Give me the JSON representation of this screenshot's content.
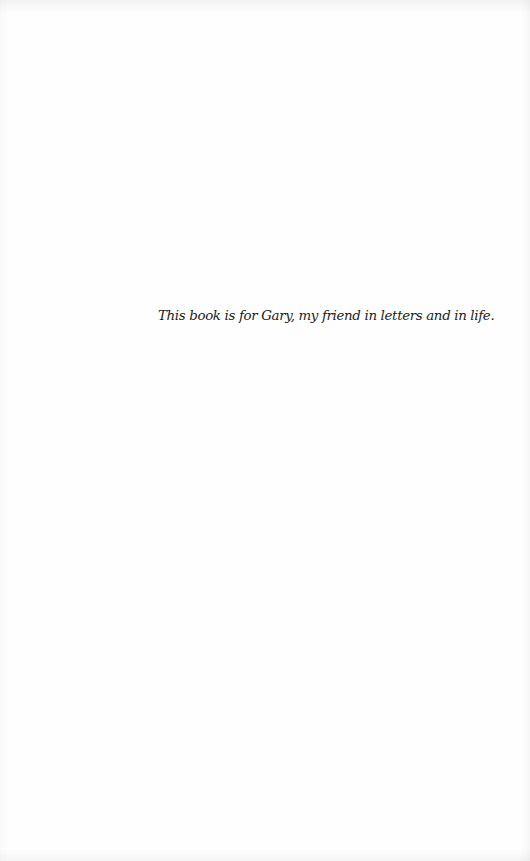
{
  "page": {
    "type": "dedication-page",
    "background_color": "#fefefe",
    "text_color": "#1c1c1c"
  },
  "dedication": {
    "text": "This book is for Gary, my friend in letters and in life."
  }
}
